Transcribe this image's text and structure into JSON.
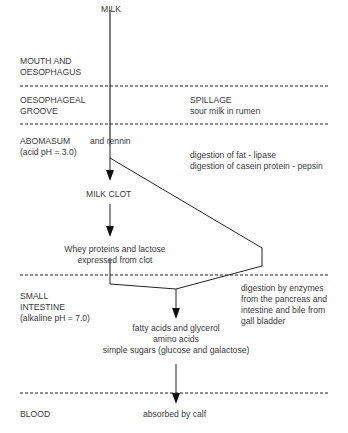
{
  "start": "MILK",
  "zones": [
    {
      "label": [
        "MOUTH AND",
        "OESOPHAGUS"
      ]
    },
    {
      "label": [
        "OESOPHAGEAL",
        "GROOVE"
      ],
      "note_title": "SPILLAGE",
      "note": "sour milk in rumen"
    },
    {
      "label": [
        "ABOMASUM",
        "(acid pH = 3.0)"
      ]
    },
    {
      "label": [
        "SMALL",
        "INTESTINE",
        "(alkaline pH = 7.0)"
      ]
    },
    {
      "label": [
        "BLOOD"
      ]
    }
  ],
  "nodes": {
    "rennin": "and rennin",
    "abomasum_digestion": [
      "digestion of fat - lipase",
      "digestion of casein protein - pepsin"
    ],
    "milk_clot": "MILK CLOT",
    "whey": [
      "Whey proteins and lactose",
      "expressed from clot"
    ],
    "intestine_digestion": [
      "digestion by enzymes",
      "from the pancreas and",
      "intestine and bile from",
      "gall bladder"
    ],
    "products": [
      "fatty acids and glycerol",
      "amino acids",
      "simple sugars (glucose and galactose)"
    ],
    "absorbed": "absorbed by calf"
  }
}
